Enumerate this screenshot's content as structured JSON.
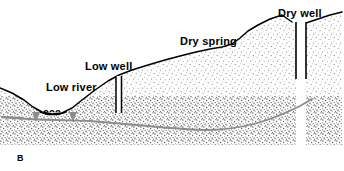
{
  "figure": {
    "panel_letter": "B",
    "caption_labels": {
      "low_river": "Low river",
      "low_well": "Low well",
      "dry_spring": "Dry spring",
      "dry_well": "Dry well"
    },
    "colors": {
      "ink": "#000000",
      "background": "#ffffff",
      "unsaturated_stipple": "#9a9a9a",
      "saturated_stipple": "#6f6f6f",
      "water_table_line": "#8c8c8c",
      "flow_arrow": "#8c8c8c"
    }
  },
  "cross_section": {
    "title_visible": false,
    "panel_letter": "B",
    "ground_surface_description": "Land surface profile: high plateau at right, descending stepped slope to the left, into a river valley at far left",
    "layers": [
      {
        "name": "unsaturated-zone",
        "label": "",
        "fill": "#9a9a9a",
        "density": "light-stipple"
      },
      {
        "name": "saturated-zone",
        "label": "",
        "fill": "#6f6f6f",
        "density": "dense-stipple"
      }
    ],
    "features": [
      {
        "id": "low-river",
        "label": "Low river",
        "type": "surface-water",
        "status": "low",
        "label_x": 46,
        "label_y": 91
      },
      {
        "id": "low-well",
        "label": "Low well",
        "type": "well",
        "status": "low",
        "label_x": 85,
        "label_y": 70,
        "shaft_x": 119,
        "shaft_top_y": 75,
        "shaft_bottom_y": 113
      },
      {
        "id": "dry-spring",
        "label": "Dry spring",
        "type": "spring",
        "status": "dry",
        "label_x": 180,
        "label_y": 45
      },
      {
        "id": "dry-well",
        "label": "Dry well",
        "type": "well",
        "status": "dry",
        "label_x": 278,
        "label_y": 17,
        "shaft_x": 302,
        "shaft_top_y": 24,
        "shaft_bottom_y": 79
      }
    ],
    "water_table": {
      "name": "lowered-water-table",
      "label": "",
      "style": "gray-curve",
      "description": "Depressed water table curving down beneath the upland and rising toward the river"
    },
    "flow_arrows": [
      {
        "id": "flow-arrow-left",
        "x": 36,
        "y": 118,
        "direction": "down-right"
      },
      {
        "id": "flow-arrow-right",
        "x": 73,
        "y": 118,
        "direction": "down-left"
      }
    ]
  }
}
